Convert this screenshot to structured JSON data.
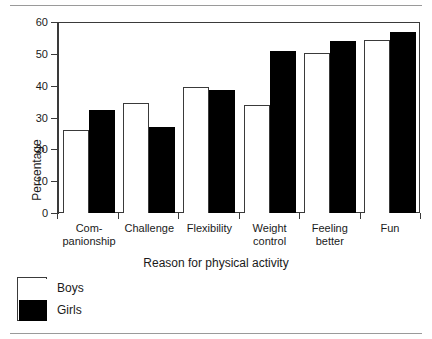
{
  "chart_data": {
    "type": "bar",
    "title": "",
    "xlabel": "Reason for physical activity",
    "ylabel": "Percentage",
    "ylim": [
      0,
      60
    ],
    "yticks": [
      0,
      10,
      20,
      30,
      40,
      50,
      60
    ],
    "grid": false,
    "legend_position": "bottom-left",
    "categories": [
      "Com- panionship",
      "Challenge",
      "Flexibility",
      "Weight control",
      "Feeling better",
      "Fun"
    ],
    "category_lines": [
      [
        "Com-",
        "panionship"
      ],
      [
        "Challenge",
        ""
      ],
      [
        "Flexibility",
        ""
      ],
      [
        "Weight",
        "control"
      ],
      [
        "Feeling",
        "better"
      ],
      [
        "Fun",
        ""
      ]
    ],
    "series": [
      {
        "name": "Boys",
        "color": "#ffffff",
        "values": [
          26,
          34.5,
          39.7,
          34,
          50.2,
          54.5
        ]
      },
      {
        "name": "Girls",
        "color": "#000000",
        "values": [
          32.5,
          27,
          38.8,
          51,
          54,
          57
        ]
      }
    ]
  },
  "legend": {
    "items": [
      {
        "label": "Boys"
      },
      {
        "label": "Girls"
      }
    ]
  }
}
